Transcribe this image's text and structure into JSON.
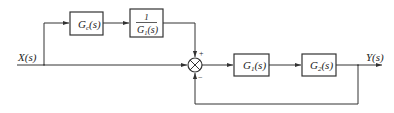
{
  "diagram": {
    "type": "control-system-block-diagram",
    "input_label": "X(s)",
    "output_label": "Y(s)",
    "blocks": {
      "gc": {
        "main": "G",
        "sub": "c",
        "arg": "(s)"
      },
      "inv_g1": {
        "numerator": "1",
        "den_main": "G",
        "den_sub": "1",
        "den_arg": "(s)"
      },
      "g1": {
        "main": "G",
        "sub": "1",
        "arg": "(s)"
      },
      "g2": {
        "main": "G",
        "sub": "2",
        "arg": "(s)"
      }
    },
    "summing_junction": {
      "top_sign": "+",
      "bottom_sign": "−"
    },
    "colors": {
      "line": "#333333",
      "text": "#222222",
      "background": "#ffffff"
    }
  }
}
